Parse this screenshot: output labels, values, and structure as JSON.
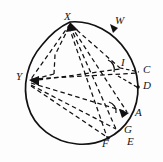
{
  "figure": {
    "type": "geometry-diagram",
    "width": 163,
    "height": 162,
    "background_color": "#fdfdfd",
    "stroke_color": "#111111",
    "label_color": "#151515",
    "circle": {
      "center_x": 85,
      "center_y": 83,
      "radius": 56,
      "arc_style": "solid",
      "note": "main circle outline drawn solid"
    },
    "points": [
      {
        "id": "X",
        "label": "X",
        "x": 70,
        "y": 22,
        "label_x": 64,
        "label_y": 11,
        "marker": true,
        "on_circle": true
      },
      {
        "id": "W",
        "label": "W",
        "x": 118,
        "y": 28,
        "label_x": 115,
        "label_y": 15,
        "marker": true,
        "on_circle": true
      },
      {
        "id": "I",
        "label": "I",
        "x": 120,
        "y": 68,
        "label_x": 121,
        "label_y": 58,
        "marker": false,
        "on_circle": false
      },
      {
        "id": "C",
        "label": "C",
        "x": 139,
        "y": 72,
        "label_x": 135,
        "label_y": 64,
        "marker": false,
        "on_circle": true
      },
      {
        "id": "D",
        "label": "D",
        "x": 138,
        "y": 87,
        "label_x": 135,
        "label_y": 80,
        "marker": true,
        "on_circle": true
      },
      {
        "id": "A",
        "label": "A",
        "x": 128,
        "y": 113,
        "label_x": 131,
        "label_y": 106,
        "marker": true,
        "on_circle": true
      },
      {
        "id": "G",
        "label": "G",
        "x": 117,
        "y": 130,
        "label_x": 121,
        "label_y": 123,
        "marker": false,
        "on_circle": true
      },
      {
        "id": "E",
        "label": "E",
        "x": 124,
        "y": 142,
        "label_x": 125,
        "label_y": 133,
        "marker": false,
        "on_circle": false
      },
      {
        "id": "F",
        "label": "F",
        "x": 108,
        "y": 138,
        "label_x": 103,
        "label_y": 131,
        "marker": true,
        "on_circle": true
      },
      {
        "id": "Y",
        "label": "Y",
        "x": 29,
        "y": 80,
        "label_x": 17,
        "label_y": 72,
        "marker": true,
        "on_circle": true
      }
    ],
    "labels": [
      "X",
      "W",
      "I",
      "C",
      "D",
      "A",
      "G",
      "E",
      "F",
      "Y"
    ],
    "dashed_segments": [
      {
        "from": "X",
        "to": "Y",
        "style": "dashed"
      },
      {
        "from": "X",
        "to": "I",
        "style": "dashed"
      },
      {
        "from": "X",
        "to": "A",
        "style": "dashed"
      },
      {
        "from": "X",
        "to": "G",
        "style": "dashed"
      },
      {
        "from": "X",
        "to": "F",
        "style": "dashed"
      },
      {
        "from": "Y",
        "to": "I",
        "style": "dashed"
      },
      {
        "from": "Y",
        "to": "C",
        "style": "dashed"
      },
      {
        "from": "Y",
        "to": "A",
        "style": "dashed"
      },
      {
        "from": "Y",
        "to": "G",
        "style": "dashed"
      },
      {
        "from": "Y",
        "to": "F",
        "style": "dashed"
      }
    ],
    "angle_marks": [
      {
        "at": "I",
        "x": 112,
        "y": 66,
        "radius": 9
      },
      {
        "at": "A",
        "x": 113,
        "y": 108,
        "radius": 9
      }
    ],
    "arrow_heads": [
      {
        "at": "X",
        "direction": "into-X"
      },
      {
        "at": "W",
        "direction": "along-arc"
      },
      {
        "at": "A",
        "direction": "into-A"
      },
      {
        "at": "Y",
        "direction": "into-Y"
      }
    ]
  }
}
